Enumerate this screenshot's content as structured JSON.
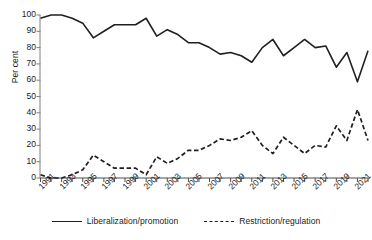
{
  "chart_data": {
    "type": "line",
    "title": "",
    "xlabel": "",
    "ylabel": "Per cent",
    "ylim": [
      0,
      100
    ],
    "ytick_step": 10,
    "yticks": [
      0,
      10,
      20,
      30,
      40,
      50,
      60,
      70,
      80,
      90,
      100
    ],
    "grid": false,
    "legend_position": "bottom",
    "x": [
      1991,
      1992,
      1993,
      1994,
      1995,
      1996,
      1997,
      1998,
      1999,
      2000,
      2001,
      2002,
      2003,
      2004,
      2005,
      2006,
      2007,
      2008,
      2009,
      2010,
      2011,
      2012,
      2013,
      2014,
      2015,
      2016,
      2017,
      2018,
      2019,
      2020,
      2021,
      2022
    ],
    "xtick_labels": [
      "1991",
      "1993",
      "1995",
      "1997",
      "1999",
      "2001",
      "2003",
      "2005",
      "2007",
      "2009",
      "2011",
      "2013",
      "2015",
      "2017",
      "2019",
      "2021"
    ],
    "xtick_values": [
      1991,
      1993,
      1995,
      1997,
      1999,
      2001,
      2003,
      2005,
      2007,
      2009,
      2011,
      2013,
      2015,
      2017,
      2019,
      2021
    ],
    "series": [
      {
        "name": "Liberalization/promotion",
        "style": "solid",
        "color": "#231f20",
        "values": [
          98,
          100,
          100,
          98,
          95,
          86,
          90,
          94,
          94,
          94,
          98,
          87,
          91,
          88,
          83,
          83,
          80,
          76,
          77,
          75,
          71,
          80,
          85,
          75,
          80,
          85,
          80,
          81,
          68,
          77,
          59,
          78
        ]
      },
      {
        "name": "Restriction/regulation",
        "style": "dashed",
        "color": "#231f20",
        "values": [
          2,
          0,
          0,
          2,
          5,
          14,
          10,
          6,
          6,
          6,
          2,
          13,
          9,
          12,
          17,
          17,
          20,
          24,
          23,
          25,
          29,
          20,
          15,
          25,
          20,
          15,
          20,
          19,
          32,
          23,
          42,
          23
        ]
      }
    ]
  },
  "axis": {
    "ylabel": "Per cent"
  },
  "legend": {
    "items": [
      {
        "label": "Liberalization/promotion",
        "style": "solid"
      },
      {
        "label": "Restriction/regulation",
        "style": "dashed"
      }
    ]
  }
}
